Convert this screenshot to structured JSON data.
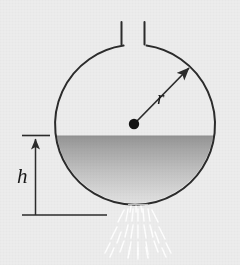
{
  "figure": {
    "background_color": "#ececec",
    "stroke_color": "#2b2b2b",
    "labels": {
      "radius": "r",
      "height": "h"
    },
    "geometry": {
      "circle": {
        "cx": 135,
        "cy": 124,
        "r": 80
      },
      "center_dot_radius": 5,
      "water_level_y": 136,
      "neck": {
        "left_x": 119,
        "right_x": 145,
        "top_y": 22,
        "bottom_y": 44
      },
      "radius_arrow": {
        "x1": 135,
        "y1": 124,
        "x2": 191,
        "y2": 67
      },
      "dimension_line": {
        "x": 35,
        "top_y": 136,
        "bottom_y": 215
      },
      "top_tick": {
        "x1": 22,
        "x2": 50,
        "y": 136
      },
      "bottom_rule": {
        "x1": 22,
        "x2": 107,
        "y": 215
      }
    },
    "colors": {
      "water_top": "#9a9a9a",
      "water_bottom": "#e3e3e3",
      "outline": "#2b2b2b",
      "spray": "#ffffff"
    },
    "annotations": {
      "radius_label_pos": {
        "x": 159,
        "y": 99
      },
      "height_label_pos": {
        "x": 22,
        "y": 182
      }
    }
  }
}
